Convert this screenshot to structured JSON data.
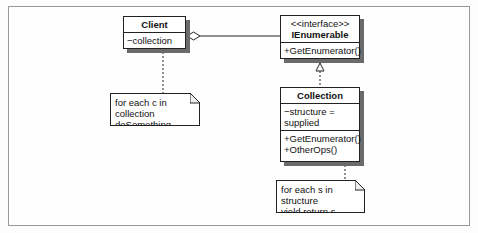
{
  "diagram": {
    "type": "UML class diagram",
    "classes": [
      {
        "id": "client",
        "name": "Client",
        "attributes": [
          "−collection"
        ],
        "operations": []
      },
      {
        "id": "ienumerable",
        "stereotype": "<<interface>>",
        "name": "IEnumerable",
        "attributes": [],
        "operations": [
          "+GetEnumerator()"
        ]
      },
      {
        "id": "collection",
        "name": "Collection",
        "attributes": [
          "−structure = supplied"
        ],
        "operations": [
          "+GetEnumerator()",
          "+OtherOps()"
        ]
      }
    ],
    "notes": [
      {
        "id": "client-note",
        "attached_to": "client.collection",
        "lines": [
          "for each c in collection",
          "doSomething"
        ]
      },
      {
        "id": "collection-note",
        "attached_to": "collection.GetEnumerator",
        "lines": [
          "for each s in structure",
          "yield return s"
        ]
      }
    ],
    "relationships": [
      {
        "type": "aggregation",
        "from": "Client",
        "to": "IEnumerable"
      },
      {
        "type": "realization",
        "from": "Collection",
        "to": "IEnumerable"
      }
    ],
    "colors": {
      "line": "#222222",
      "shadow": "#6b6b6b",
      "frame": "#9a9a9a",
      "background": "#fefefe"
    }
  }
}
